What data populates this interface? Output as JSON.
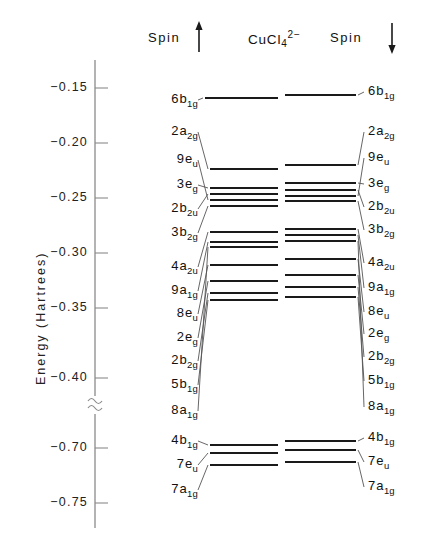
{
  "figure": {
    "species": "CuCl",
    "species_sub": "4",
    "species_sup": "2−",
    "axis_title": "Energy (Hartrees)",
    "spin_up_header": "Spin",
    "spin_down_header": "Spin",
    "spin_up_arrow": "up-arrow-icon",
    "spin_down_arrow": "down-arrow-icon",
    "axis_break_symbol": "≈"
  },
  "axis": {
    "tick_labels": [
      "-0.15",
      "-0.20",
      "-0.25",
      "-0.30",
      "-0.35",
      "-0.40",
      "-0.70",
      "-0.75"
    ],
    "tick_values": [
      -0.15,
      -0.2,
      -0.25,
      -0.3,
      -0.35,
      -0.4,
      -0.7,
      -0.75
    ],
    "tick_y": [
      88,
      143,
      198,
      253,
      308,
      378,
      448,
      503
    ],
    "break_y": 405,
    "axis_x": 95,
    "axis_top": 60,
    "axis_bottom": 528
  },
  "chart_data": {
    "type": "energy-level-diagram",
    "ylabel": "Energy (Hartrees)",
    "ylim": [
      -0.77,
      -0.13
    ],
    "axis_break": [
      -0.42,
      -0.68
    ],
    "grid": false,
    "legend": "none",
    "series": [
      {
        "name": "Spin up",
        "levels": [
          {
            "label_pre": "6",
            "label_main": "b",
            "label_sub": "1g",
            "energy": -0.135,
            "y": 98,
            "label_y": 99,
            "x1": 205,
            "x2": 278,
            "drawn": false
          },
          {
            "label_pre": "2",
            "label_main": "a",
            "label_sub": "2g",
            "energy": -0.163,
            "y": 169,
            "label_y": 131,
            "x1": 210,
            "x2": 278
          },
          {
            "label_pre": "9",
            "label_main": "e",
            "label_sub": "u",
            "energy": -0.209,
            "y": 200,
            "label_y": 159,
            "x1": 210,
            "x2": 278
          },
          {
            "label_pre": "3",
            "label_main": "e",
            "label_sub": "g",
            "energy": -0.222,
            "y": 188,
            "label_y": 184,
            "x1": 210,
            "x2": 278
          },
          {
            "label_pre": "2",
            "label_main": "b",
            "label_sub": "2u",
            "energy": -0.234,
            "y": 194,
            "label_y": 208,
            "x1": 210,
            "x2": 278
          },
          {
            "label_pre": "3",
            "label_main": "b",
            "label_sub": "2g",
            "energy": -0.24,
            "y": 206,
            "label_y": 232,
            "x1": 210,
            "x2": 278
          },
          {
            "label_pre": "4",
            "label_main": "a",
            "label_sub": "2u",
            "energy": -0.281,
            "y": 232,
            "label_y": 266,
            "x1": 210,
            "x2": 278
          },
          {
            "label_pre": "9",
            "label_main": "a",
            "label_sub": "1g",
            "energy": -0.29,
            "y": 242,
            "label_y": 290,
            "x1": 210,
            "x2": 278
          },
          {
            "label_pre": "8",
            "label_main": "e",
            "label_sub": "u",
            "energy": -0.312,
            "y": 265,
            "label_y": 313,
            "x1": 210,
            "x2": 278
          },
          {
            "label_pre": "2",
            "label_main": "e",
            "label_sub": "g",
            "energy": -0.326,
            "y": 281,
            "label_y": 337,
            "x1": 210,
            "x2": 278
          },
          {
            "label_pre": "2",
            "label_main": "b",
            "label_sub": "2g",
            "energy": -0.337,
            "y": 293,
            "label_y": 360,
            "x1": 210,
            "x2": 278
          },
          {
            "label_pre": "5",
            "label_main": "b",
            "label_sub": "1g",
            "energy": -0.343,
            "y": 300,
            "label_y": 384,
            "x1": 210,
            "x2": 278
          },
          {
            "label_pre": "8",
            "label_main": "a",
            "label_sub": "1g",
            "energy": -0.347,
            "y": 247,
            "label_y": 410,
            "x1": 210,
            "x2": 278
          },
          {
            "label_pre": "4",
            "label_main": "b",
            "label_sub": "1g",
            "energy": -0.698,
            "y": 445,
            "label_y": 440,
            "x1": 210,
            "x2": 278
          },
          {
            "label_pre": "7",
            "label_main": "e",
            "label_sub": "u",
            "energy": -0.705,
            "y": 453,
            "label_y": 464,
            "x1": 210,
            "x2": 278
          },
          {
            "label_pre": "7",
            "label_main": "a",
            "label_sub": "1g",
            "energy": -0.716,
            "y": 465,
            "label_y": 489,
            "x1": 210,
            "x2": 278
          }
        ]
      },
      {
        "name": "Spin down",
        "levels": [
          {
            "label_pre": "6",
            "label_main": "b",
            "label_sub": "1g",
            "energy": -0.132,
            "y": 95,
            "label_y": 91,
            "x1": 285,
            "x2": 356
          },
          {
            "label_pre": "2",
            "label_main": "a",
            "label_sub": "2g",
            "energy": -0.16,
            "y": 165,
            "label_y": 131,
            "x1": 285,
            "x2": 356
          },
          {
            "label_pre": "9",
            "label_main": "e",
            "label_sub": "u",
            "energy": -0.206,
            "y": 196,
            "label_y": 157,
            "x1": 285,
            "x2": 356
          },
          {
            "label_pre": "3",
            "label_main": "e",
            "label_sub": "g",
            "energy": -0.218,
            "y": 183,
            "label_y": 183,
            "x1": 285,
            "x2": 356
          },
          {
            "label_pre": "2",
            "label_main": "b",
            "label_sub": "2u",
            "energy": -0.231,
            "y": 190,
            "label_y": 206,
            "x1": 285,
            "x2": 356
          },
          {
            "label_pre": "3",
            "label_main": "b",
            "label_sub": "2g",
            "energy": -0.236,
            "y": 201,
            "label_y": 229,
            "x1": 285,
            "x2": 356
          },
          {
            "label_pre": "4",
            "label_main": "a",
            "label_sub": "2u",
            "energy": -0.278,
            "y": 229,
            "label_y": 262,
            "x1": 285,
            "x2": 356
          },
          {
            "label_pre": "9",
            "label_main": "a",
            "label_sub": "1g",
            "energy": -0.284,
            "y": 235,
            "label_y": 287,
            "x1": 285,
            "x2": 356
          },
          {
            "label_pre": "8",
            "label_main": "e",
            "label_sub": "u",
            "energy": -0.308,
            "y": 259,
            "label_y": 311,
            "x1": 285,
            "x2": 356
          },
          {
            "label_pre": "2",
            "label_main": "e",
            "label_sub": "g",
            "energy": -0.322,
            "y": 275,
            "label_y": 333,
            "x1": 285,
            "x2": 356
          },
          {
            "label_pre": "2",
            "label_main": "b",
            "label_sub": "2g",
            "energy": -0.333,
            "y": 287,
            "label_y": 356,
            "x1": 285,
            "x2": 356
          },
          {
            "label_pre": "5",
            "label_main": "b",
            "label_sub": "1g",
            "energy": -0.342,
            "y": 297,
            "label_y": 380,
            "x1": 285,
            "x2": 356
          },
          {
            "label_pre": "8",
            "label_main": "a",
            "label_sub": "1g",
            "energy": -0.345,
            "y": 241,
            "label_y": 406,
            "x1": 285,
            "x2": 356
          },
          {
            "label_pre": "4",
            "label_main": "b",
            "label_sub": "1g",
            "energy": -0.694,
            "y": 441,
            "label_y": 437,
            "x1": 285,
            "x2": 356
          },
          {
            "label_pre": "7",
            "label_main": "e",
            "label_sub": "u",
            "energy": -0.702,
            "y": 450,
            "label_y": 461,
            "x1": 285,
            "x2": 356
          },
          {
            "label_pre": "7",
            "label_main": "a",
            "label_sub": "1g",
            "energy": -0.713,
            "y": 462,
            "label_y": 486,
            "x1": 285,
            "x2": 356
          }
        ]
      }
    ]
  }
}
